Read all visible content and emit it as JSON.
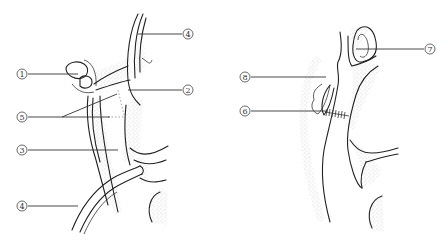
{
  "figure": {
    "left_panel": {
      "labels": [
        {
          "id": "label-1",
          "text": "1"
        },
        {
          "id": "label-5",
          "text": "5"
        },
        {
          "id": "label-3",
          "text": "3"
        },
        {
          "id": "label-4-bottom",
          "text": "4"
        },
        {
          "id": "label-4-top",
          "text": "4"
        },
        {
          "id": "label-2",
          "text": "2"
        }
      ]
    },
    "right_panel": {
      "labels": [
        {
          "id": "label-8",
          "text": "8"
        },
        {
          "id": "label-6",
          "text": "6"
        },
        {
          "id": "label-7",
          "text": "7"
        }
      ]
    }
  }
}
